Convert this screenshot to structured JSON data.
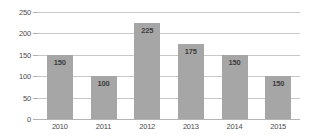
{
  "chart_data": {
    "type": "bar",
    "title": "",
    "subtitle": "",
    "xlabel": "",
    "ylabel": "",
    "categories": [
      "2010",
      "2011",
      "2012",
      "2013",
      "2014",
      "2015"
    ],
    "values": [
      150,
      100,
      225,
      175,
      150,
      100
    ],
    "data_labels": [
      "150",
      "100",
      "225",
      "175",
      "150",
      "150"
    ],
    "series": [
      {
        "name": "",
        "values": [
          150,
          100,
          225,
          175,
          150,
          100
        ]
      }
    ],
    "ylim": [
      0,
      250
    ],
    "ytick_values": [
      0,
      50,
      100,
      150,
      200,
      250
    ],
    "ytick_labels": [
      "0",
      "50",
      "100",
      "150",
      "200",
      "250"
    ],
    "grid": true,
    "grid_axis": "y",
    "legend": false,
    "legend_position": "none",
    "bar_color": "#a6a6a6",
    "gridline_color": "#c8c8c8",
    "axis_text_color": "#4a4a4a",
    "label_text_color": "#3d3d3d",
    "background_color": "#ffffff"
  }
}
